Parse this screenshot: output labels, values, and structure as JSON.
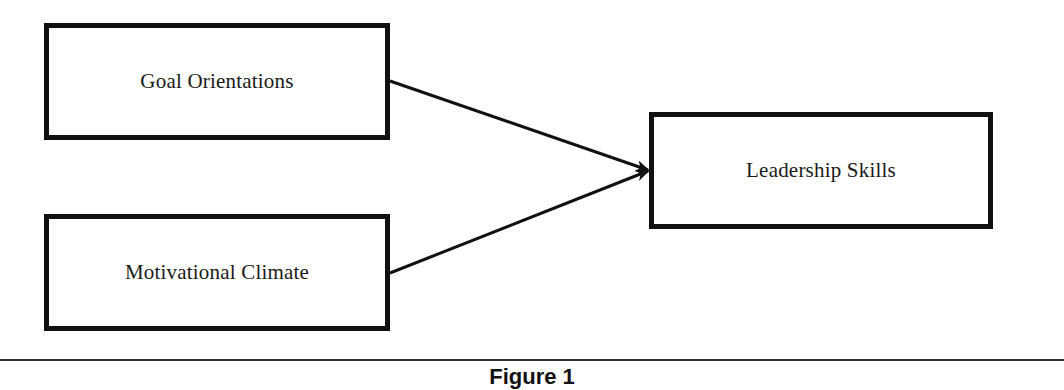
{
  "diagram": {
    "nodes": [
      {
        "id": "goal-orientations",
        "label": "Goal Orientations"
      },
      {
        "id": "motivational-climate",
        "label": "Motivational Climate"
      },
      {
        "id": "leadership-skills",
        "label": "Leadership Skills"
      }
    ],
    "edges": [
      {
        "from": "goal-orientations",
        "to": "leadership-skills"
      },
      {
        "from": "motivational-climate",
        "to": "leadership-skills"
      }
    ],
    "colors": {
      "stroke": "#111111",
      "background": "#ffffff"
    }
  },
  "caption": {
    "text": "Figure 1"
  }
}
